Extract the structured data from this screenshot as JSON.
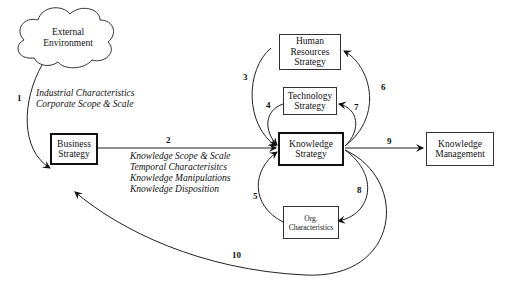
{
  "diagram": {
    "nodes": {
      "external_environment": {
        "line1": "External",
        "line2": "Environment",
        "shape": "cloud"
      },
      "business_strategy": {
        "line1": "Business",
        "line2": "Strategy",
        "border": "thick"
      },
      "hr_strategy": {
        "line1": "Human",
        "line2": "Resources",
        "line3": "Strategy",
        "border": "thin"
      },
      "technology_strategy": {
        "line1": "Technology",
        "line2": "Strategy",
        "border": "thin"
      },
      "knowledge_strategy": {
        "line1": "Knowledge",
        "line2": "Strategy",
        "border": "thick"
      },
      "knowledge_management": {
        "line1": "Knowledge",
        "line2": "Management",
        "border": "thin"
      },
      "org_characteristics": {
        "line1": "Org.",
        "line2": "Characteristics",
        "border": "thin"
      }
    },
    "edges": [
      {
        "id": "1",
        "from": "External Environment",
        "to": "Business Strategy"
      },
      {
        "id": "2",
        "from": "Business Strategy",
        "to": "Knowledge Strategy"
      },
      {
        "id": "3",
        "from": "Human Resources Strategy",
        "to": "Knowledge Strategy"
      },
      {
        "id": "4",
        "from": "Technology Strategy",
        "to": "Knowledge Strategy"
      },
      {
        "id": "5",
        "from": "Org. Characteristics",
        "to": "Knowledge Strategy"
      },
      {
        "id": "6",
        "from": "Knowledge Strategy",
        "to": "Human Resources Strategy"
      },
      {
        "id": "7",
        "from": "Knowledge Strategy",
        "to": "Technology Strategy"
      },
      {
        "id": "8",
        "from": "Knowledge Strategy",
        "to": "Org. Characteristics"
      },
      {
        "id": "9",
        "from": "Knowledge Strategy",
        "to": "Knowledge Management"
      },
      {
        "id": "10",
        "from": "Knowledge Strategy",
        "to": "Business Strategy"
      }
    ],
    "edge1_attributes": [
      "Industrial Characteristics",
      "Corporate Scope & Scale"
    ],
    "edge2_attributes": [
      "Knowledge Scope & Scale",
      "Temporal Characterisitcs",
      "Knowledge Manipulations",
      "Knowledge Disposition"
    ]
  }
}
